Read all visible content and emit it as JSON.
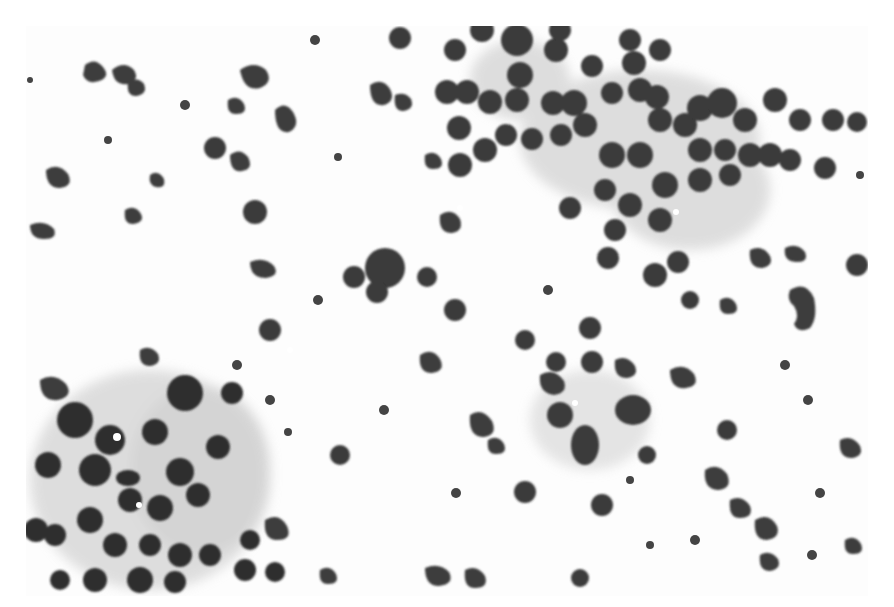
{
  "image": {
    "kind": "micrograph",
    "description": "Grayscale cytology smear showing clusters of round dark nuclei, scattered neutrophils, and pale cytoplasm sheets",
    "palette": {
      "background": "#fdfdfd",
      "nucleus": "#3a3a3a",
      "nucleus_dark": "#2b2b2b",
      "cytoplasm": "#cfcfcf",
      "cytoplasm_light": "#e4e4e4"
    }
  }
}
